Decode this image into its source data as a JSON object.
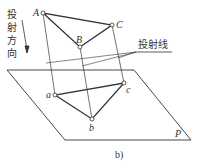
{
  "diagram": {
    "direction_label": "投射方向",
    "projection_line_label": "投射线",
    "plane_label": "P",
    "caption": "b)",
    "space_points": {
      "A": {
        "label": "A",
        "x": 43,
        "y": 13
      },
      "B": {
        "label": "B",
        "x": 80,
        "y": 47
      },
      "C": {
        "label": "C",
        "x": 112,
        "y": 25
      }
    },
    "projected_points": {
      "a": {
        "label": "a",
        "x": 55,
        "y": 95
      },
      "b": {
        "label": "b",
        "x": 92,
        "y": 119
      },
      "c": {
        "label": "c",
        "x": 124,
        "y": 83
      }
    },
    "plane_corners": [
      [
        7,
        70
      ],
      [
        134,
        70
      ],
      [
        191,
        140
      ],
      [
        65,
        140
      ]
    ],
    "line_color": "#333333"
  }
}
